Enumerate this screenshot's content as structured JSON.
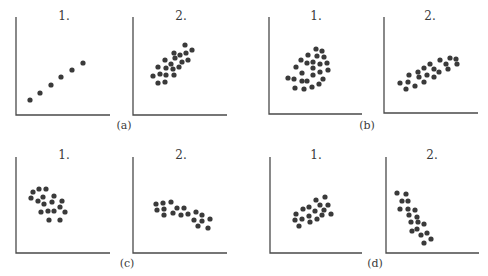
{
  "figure": {
    "colors": {
      "dots": "#3a3a3a",
      "axes": "#4a4a4a",
      "text": "#3a3a3a",
      "background": "#ffffff"
    }
  },
  "chart_data": [
    {
      "type": "scatter",
      "group": "(a)",
      "panel": "1.",
      "title": "1.",
      "xlabel": "",
      "ylabel": "",
      "grid": false,
      "axes_px": {
        "left": 16,
        "top": 17,
        "bottom": 115,
        "right": 110
      },
      "points": [
        [
          30,
          100
        ],
        [
          40,
          93
        ],
        [
          51,
          85
        ],
        [
          61,
          77
        ],
        [
          72,
          70
        ],
        [
          83,
          63
        ]
      ]
    },
    {
      "type": "scatter",
      "group": "(a)",
      "panel": "2.",
      "title": "2.",
      "xlabel": "",
      "ylabel": "",
      "grid": false,
      "axes_px": {
        "left": 133,
        "top": 17,
        "bottom": 115,
        "right": 227
      },
      "points": [
        [
          153,
          76
        ],
        [
          158,
          83
        ],
        [
          160,
          74
        ],
        [
          158,
          67
        ],
        [
          165,
          82
        ],
        [
          166,
          75
        ],
        [
          166,
          68
        ],
        [
          165,
          60
        ],
        [
          171,
          64
        ],
        [
          173,
          69
        ],
        [
          174,
          75
        ],
        [
          174,
          53
        ],
        [
          175,
          58
        ],
        [
          179,
          67
        ],
        [
          180,
          55
        ],
        [
          182,
          62
        ],
        [
          185,
          45
        ],
        [
          186,
          53
        ],
        [
          188,
          60
        ],
        [
          192,
          50
        ]
      ]
    },
    {
      "type": "scatter",
      "group": "(b)",
      "panel": "1.",
      "title": "1.",
      "xlabel": "",
      "ylabel": "",
      "grid": false,
      "axes_px": {
        "left": 269,
        "top": 17,
        "bottom": 114,
        "right": 362
      },
      "points": [
        [
          288,
          78
        ],
        [
          294,
          79
        ],
        [
          295,
          88
        ],
        [
          296,
          67
        ],
        [
          301,
          60
        ],
        [
          302,
          73
        ],
        [
          302,
          81
        ],
        [
          304,
          89
        ],
        [
          307,
          81
        ],
        [
          307,
          63
        ],
        [
          308,
          55
        ],
        [
          312,
          87
        ],
        [
          313,
          75
        ],
        [
          313,
          68
        ],
        [
          313,
          62
        ],
        [
          316,
          49
        ],
        [
          317,
          56
        ],
        [
          319,
          84
        ],
        [
          320,
          72
        ],
        [
          320,
          64
        ],
        [
          322,
          51
        ],
        [
          323,
          79
        ],
        [
          324,
          57
        ],
        [
          327,
          63
        ],
        [
          328,
          70
        ]
      ]
    },
    {
      "type": "scatter",
      "group": "(b)",
      "panel": "2.",
      "title": "2.",
      "xlabel": "",
      "ylabel": "",
      "grid": false,
      "axes_px": {
        "left": 384,
        "top": 17,
        "bottom": 113,
        "right": 478
      },
      "points": [
        [
          400,
          83
        ],
        [
          406,
          89
        ],
        [
          408,
          82
        ],
        [
          409,
          75
        ],
        [
          415,
          86
        ],
        [
          418,
          72
        ],
        [
          419,
          77
        ],
        [
          424,
          82
        ],
        [
          424,
          68
        ],
        [
          427,
          75
        ],
        [
          430,
          64
        ],
        [
          434,
          77
        ],
        [
          434,
          69
        ],
        [
          439,
          72
        ],
        [
          440,
          60
        ],
        [
          446,
          64
        ],
        [
          448,
          69
        ],
        [
          450,
          58
        ],
        [
          456,
          59
        ],
        [
          457,
          64
        ]
      ]
    },
    {
      "type": "scatter",
      "group": "(c)",
      "panel": "1.",
      "title": "1.",
      "xlabel": "",
      "ylabel": "",
      "grid": false,
      "axes_px": {
        "left": 16,
        "top": 157,
        "bottom": 253,
        "right": 110
      },
      "points": [
        [
          31,
          198
        ],
        [
          33,
          192
        ],
        [
          39,
          189
        ],
        [
          46,
          189
        ],
        [
          38,
          201
        ],
        [
          43,
          197
        ],
        [
          44,
          204
        ],
        [
          52,
          202
        ],
        [
          54,
          196
        ],
        [
          41,
          212
        ],
        [
          48,
          211
        ],
        [
          54,
          211
        ],
        [
          60,
          207
        ],
        [
          62,
          201
        ],
        [
          65,
          212
        ],
        [
          49,
          220
        ],
        [
          60,
          220
        ]
      ]
    },
    {
      "type": "scatter",
      "group": "(c)",
      "panel": "2.",
      "title": "2.",
      "xlabel": "",
      "ylabel": "",
      "grid": false,
      "axes_px": {
        "left": 133,
        "top": 157,
        "bottom": 253,
        "right": 227
      },
      "points": [
        [
          156,
          204
        ],
        [
          157,
          210
        ],
        [
          163,
          203
        ],
        [
          164,
          209
        ],
        [
          164,
          215
        ],
        [
          171,
          202
        ],
        [
          173,
          213
        ],
        [
          177,
          208
        ],
        [
          181,
          215
        ],
        [
          184,
          208
        ],
        [
          188,
          214
        ],
        [
          194,
          220
        ],
        [
          196,
          212
        ],
        [
          198,
          226
        ],
        [
          202,
          215
        ],
        [
          202,
          221
        ],
        [
          208,
          228
        ],
        [
          210,
          219
        ]
      ]
    },
    {
      "type": "scatter",
      "group": "(d)",
      "panel": "1.",
      "title": "1.",
      "xlabel": "",
      "ylabel": "",
      "grid": false,
      "axes_px": {
        "left": 270,
        "top": 157,
        "bottom": 253,
        "right": 362
      },
      "points": [
        [
          295,
          220
        ],
        [
          296,
          214
        ],
        [
          299,
          226
        ],
        [
          302,
          219
        ],
        [
          303,
          209
        ],
        [
          309,
          216
        ],
        [
          309,
          207
        ],
        [
          310,
          222
        ],
        [
          315,
          211
        ],
        [
          316,
          200
        ],
        [
          317,
          219
        ],
        [
          320,
          205
        ],
        [
          322,
          215
        ],
        [
          324,
          210
        ],
        [
          325,
          197
        ],
        [
          328,
          205
        ],
        [
          331,
          214
        ]
      ]
    },
    {
      "type": "scatter",
      "group": "(d)",
      "panel": "2.",
      "title": "2.",
      "xlabel": "",
      "ylabel": "",
      "grid": false,
      "axes_px": {
        "left": 386,
        "top": 157,
        "bottom": 253,
        "right": 479
      },
      "points": [
        [
          397,
          193
        ],
        [
          406,
          194
        ],
        [
          402,
          201
        ],
        [
          408,
          201
        ],
        [
          400,
          209
        ],
        [
          408,
          209
        ],
        [
          415,
          210
        ],
        [
          409,
          215
        ],
        [
          417,
          217
        ],
        [
          411,
          222
        ],
        [
          418,
          222
        ],
        [
          424,
          224
        ],
        [
          412,
          231
        ],
        [
          417,
          229
        ],
        [
          427,
          233
        ],
        [
          421,
          235
        ],
        [
          431,
          239
        ],
        [
          424,
          243
        ]
      ]
    }
  ],
  "labels": {
    "groups": [
      {
        "text": "(a)",
        "x": 124,
        "y": 129
      },
      {
        "text": "(b)",
        "x": 367,
        "y": 129
      },
      {
        "text": "(c)",
        "x": 127,
        "y": 267
      },
      {
        "text": "(d)",
        "x": 375,
        "y": 267
      }
    ],
    "panel_titles": [
      {
        "text": "1.",
        "x": 64,
        "y": 20
      },
      {
        "text": "2.",
        "x": 181,
        "y": 20
      },
      {
        "text": "1.",
        "x": 316,
        "y": 20
      },
      {
        "text": "2.",
        "x": 430,
        "y": 20
      },
      {
        "text": "1.",
        "x": 64,
        "y": 159
      },
      {
        "text": "2.",
        "x": 181,
        "y": 159
      },
      {
        "text": "1.",
        "x": 316,
        "y": 159
      },
      {
        "text": "2.",
        "x": 432,
        "y": 159
      }
    ]
  }
}
